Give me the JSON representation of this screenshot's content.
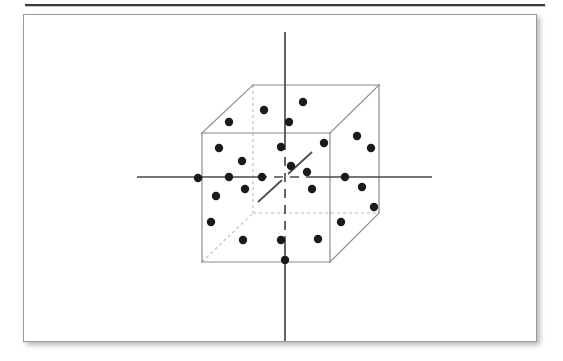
{
  "page": {
    "background_color": "#ffffff",
    "width": 563,
    "height": 361
  },
  "top_rule": {
    "color": "#3a3a3a",
    "shadow_color": "#c9c9c9"
  },
  "panel": {
    "background_color": "#ffffff",
    "border_color": "#9a9a9a",
    "shadow": "drop-shadow"
  },
  "figure": {
    "title": "",
    "caption": "",
    "colors": {
      "cube_edge_visible": "#8a8a8a",
      "cube_edge_hidden": "#b9b9b9",
      "axis": "#4a4a4a",
      "dot": "#1b1b1b"
    },
    "cube": {
      "front_face": {
        "top_left": [
          202,
          133
        ],
        "top_right": [
          330,
          133
        ],
        "bottom_right": [
          330,
          262
        ],
        "bottom_left": [
          202,
          262
        ]
      },
      "back_face": {
        "top_left": [
          253,
          85
        ],
        "top_right": [
          379,
          85
        ],
        "bottom_right": [
          379,
          213
        ],
        "bottom_left": [
          253,
          213
        ]
      },
      "hidden_edges": [
        "back-left-vertical",
        "back-bottom-left-diagonal",
        "back-bottom-horizontal"
      ]
    },
    "axes": [
      {
        "name": "horizontal-axis",
        "x1": 137,
        "y1": 177,
        "x2": 432,
        "y2": 177,
        "style": "solid-outside-dashed-inside"
      },
      {
        "name": "vertical-axis",
        "x1": 285,
        "y1": 32,
        "x2": 285,
        "y2": 341,
        "style": "solid-outside-dashed-inside"
      },
      {
        "name": "depth-axis",
        "x1": 258,
        "y1": 205,
        "x2": 310,
        "y2": 155,
        "style": "short-oblique"
      }
    ],
    "dots": [
      [
        264,
        110
      ],
      [
        303,
        102
      ],
      [
        229,
        122
      ],
      [
        289,
        122
      ],
      [
        219,
        148
      ],
      [
        281,
        147
      ],
      [
        324,
        143
      ],
      [
        357,
        136
      ],
      [
        371,
        148
      ],
      [
        242,
        161
      ],
      [
        229,
        177
      ],
      [
        262,
        177
      ],
      [
        307,
        172
      ],
      [
        345,
        177
      ],
      [
        291,
        166
      ],
      [
        312,
        189
      ],
      [
        362,
        187
      ],
      [
        216,
        196
      ],
      [
        245,
        189
      ],
      [
        374,
        207
      ],
      [
        211,
        222
      ],
      [
        341,
        222
      ],
      [
        243,
        240
      ],
      [
        281,
        240
      ],
      [
        318,
        239
      ],
      [
        285,
        260
      ],
      [
        198,
        178
      ]
    ],
    "dot_radius": 4.2
  }
}
